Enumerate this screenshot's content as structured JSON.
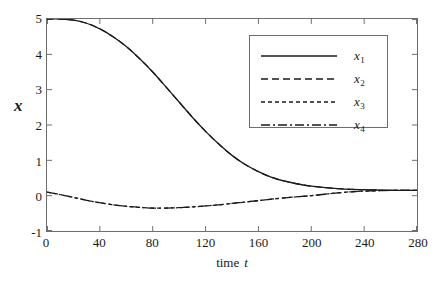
{
  "chart_data": {
    "type": "line",
    "title": "",
    "xlabel": "time  t",
    "xlabel_text": "time",
    "xlabel_symbol": "t",
    "ylabel": "x",
    "xlim": [
      0,
      280
    ],
    "ylim": [
      -1,
      5
    ],
    "xticks": [
      0,
      40,
      80,
      120,
      160,
      200,
      240,
      280
    ],
    "yticks": [
      -1,
      0,
      1,
      2,
      3,
      4,
      5
    ],
    "xtick_labels": [
      "0",
      "40",
      "80",
      "120",
      "160",
      "200",
      "240",
      "280"
    ],
    "ytick_labels": [
      "-1",
      "0",
      "1",
      "2",
      "3",
      "4",
      "5"
    ],
    "grid": false,
    "legend_position": "upper right",
    "line_color": "#1a1a1a",
    "frame_color": "#6e6e6e",
    "background": "#ffffff",
    "series": [
      {
        "name": "x1",
        "label": "x",
        "subscript": "1",
        "style": "solid",
        "dasharray": "",
        "x": [
          0,
          10,
          20,
          30,
          40,
          50,
          60,
          70,
          80,
          90,
          100,
          110,
          120,
          130,
          140,
          150,
          160,
          170,
          180,
          190,
          200,
          210,
          220,
          230,
          240,
          250,
          260,
          270,
          280
        ],
        "y": [
          5.0,
          5.0,
          4.97,
          4.88,
          4.72,
          4.5,
          4.22,
          3.88,
          3.5,
          3.08,
          2.65,
          2.22,
          1.82,
          1.46,
          1.14,
          0.88,
          0.68,
          0.52,
          0.41,
          0.33,
          0.27,
          0.23,
          0.2,
          0.18,
          0.17,
          0.16,
          0.15,
          0.15,
          0.15
        ]
      },
      {
        "name": "x2",
        "label": "x",
        "subscript": "2",
        "style": "dashed",
        "dasharray": "7,4",
        "x": [
          0,
          10,
          20,
          30,
          40,
          50,
          60,
          70,
          80,
          90,
          100,
          110,
          120,
          130,
          140,
          150,
          160,
          170,
          180,
          190,
          200,
          210,
          220,
          230,
          240,
          250,
          260,
          270,
          280
        ],
        "y": [
          5.0,
          5.0,
          4.97,
          4.88,
          4.72,
          4.5,
          4.22,
          3.88,
          3.5,
          3.08,
          2.65,
          2.22,
          1.82,
          1.46,
          1.14,
          0.88,
          0.68,
          0.52,
          0.41,
          0.33,
          0.27,
          0.23,
          0.2,
          0.18,
          0.17,
          0.16,
          0.15,
          0.15,
          0.15
        ]
      },
      {
        "name": "x3",
        "label": "x",
        "subscript": "3",
        "style": "dotted",
        "dasharray": "4,3",
        "x": [
          0,
          10,
          20,
          30,
          40,
          50,
          60,
          70,
          80,
          90,
          100,
          110,
          120,
          130,
          140,
          150,
          160,
          170,
          180,
          190,
          200,
          210,
          220,
          230,
          240,
          250,
          260,
          270,
          280
        ],
        "y": [
          0.1,
          0.03,
          -0.05,
          -0.13,
          -0.2,
          -0.26,
          -0.3,
          -0.33,
          -0.35,
          -0.35,
          -0.34,
          -0.32,
          -0.29,
          -0.26,
          -0.22,
          -0.18,
          -0.14,
          -0.1,
          -0.06,
          -0.03,
          0.0,
          0.04,
          0.08,
          0.11,
          0.13,
          0.14,
          0.15,
          0.15,
          0.15
        ]
      },
      {
        "name": "x4",
        "label": "x",
        "subscript": "4",
        "style": "dashdot",
        "dasharray": "9,3,2,3",
        "x": [
          0,
          10,
          20,
          30,
          40,
          50,
          60,
          70,
          80,
          90,
          100,
          110,
          120,
          130,
          140,
          150,
          160,
          170,
          180,
          190,
          200,
          210,
          220,
          230,
          240,
          250,
          260,
          270,
          280
        ],
        "y": [
          0.1,
          0.03,
          -0.05,
          -0.13,
          -0.2,
          -0.26,
          -0.3,
          -0.33,
          -0.35,
          -0.35,
          -0.34,
          -0.32,
          -0.29,
          -0.26,
          -0.22,
          -0.18,
          -0.14,
          -0.1,
          -0.06,
          -0.03,
          0.0,
          0.04,
          0.08,
          0.11,
          0.13,
          0.14,
          0.15,
          0.15,
          0.15
        ]
      }
    ]
  }
}
